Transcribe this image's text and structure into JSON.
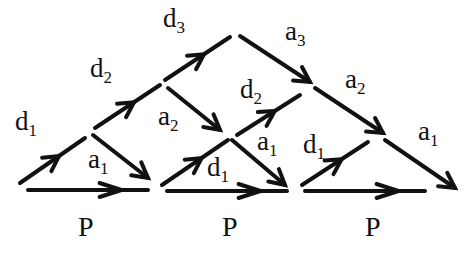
{
  "diagram": {
    "edges": [
      {
        "id": "d1-left",
        "label": "d",
        "sub": "1",
        "x1": 20,
        "y1": 183,
        "x2": 85,
        "y2": 138
      },
      {
        "id": "a1-left",
        "label": "a",
        "sub": "1",
        "x1": 93,
        "y1": 135,
        "x2": 148,
        "y2": 178
      },
      {
        "id": "d2-left",
        "label": "d",
        "sub": "2",
        "x1": 95,
        "y1": 128,
        "x2": 160,
        "y2": 85
      },
      {
        "id": "a2-left",
        "label": "a",
        "sub": "2",
        "x1": 168,
        "y1": 88,
        "x2": 220,
        "y2": 130
      },
      {
        "id": "d3",
        "label": "d",
        "sub": "3",
        "x1": 165,
        "y1": 80,
        "x2": 230,
        "y2": 37
      },
      {
        "id": "a3",
        "label": "a",
        "sub": "3",
        "x1": 240,
        "y1": 36,
        "x2": 310,
        "y2": 82
      },
      {
        "id": "d1-mid",
        "label": "d",
        "sub": "1",
        "x1": 162,
        "y1": 185,
        "x2": 228,
        "y2": 140
      },
      {
        "id": "a1-mid",
        "label": "a",
        "sub": "1",
        "x1": 232,
        "y1": 140,
        "x2": 285,
        "y2": 185
      },
      {
        "id": "d2-mid",
        "label": "d",
        "sub": "2",
        "x1": 237,
        "y1": 135,
        "x2": 300,
        "y2": 95
      },
      {
        "id": "a2-right",
        "label": "a",
        "sub": "2",
        "x1": 315,
        "y1": 88,
        "x2": 383,
        "y2": 133
      },
      {
        "id": "d1-right",
        "label": "d",
        "sub": "1",
        "x1": 302,
        "y1": 185,
        "x2": 368,
        "y2": 142
      },
      {
        "id": "a1-right",
        "label": "a",
        "sub": "1",
        "x1": 385,
        "y1": 140,
        "x2": 455,
        "y2": 188
      }
    ],
    "labels": [
      {
        "text": "d",
        "sub": "1",
        "x": 15,
        "y": 130
      },
      {
        "text": "a",
        "sub": "1",
        "x": 88,
        "y": 168
      },
      {
        "text": "d",
        "sub": "2",
        "x": 90,
        "y": 77
      },
      {
        "text": "a",
        "sub": "2",
        "x": 158,
        "y": 125
      },
      {
        "text": "d",
        "sub": "3",
        "x": 163,
        "y": 27
      },
      {
        "text": "a",
        "sub": "3",
        "x": 285,
        "y": 40
      },
      {
        "text": "d",
        "sub": "2",
        "x": 240,
        "y": 98
      },
      {
        "text": "a",
        "sub": "1",
        "x": 257,
        "y": 150
      },
      {
        "text": "d",
        "sub": "1",
        "x": 207,
        "y": 176
      },
      {
        "text": "a",
        "sub": "2",
        "x": 345,
        "y": 88
      },
      {
        "text": "d",
        "sub": "1",
        "x": 303,
        "y": 153
      },
      {
        "text": "a",
        "sub": "1",
        "x": 418,
        "y": 140
      }
    ],
    "p_steps": [
      {
        "label": "P",
        "x1": 28,
        "x2": 148,
        "y": 190,
        "label_x": 78,
        "label_y": 236
      },
      {
        "label": "P",
        "x1": 167,
        "x2": 287,
        "y": 191,
        "label_x": 222,
        "label_y": 236
      },
      {
        "label": "P",
        "x1": 305,
        "x2": 425,
        "y": 191,
        "label_x": 365,
        "label_y": 236
      }
    ]
  }
}
